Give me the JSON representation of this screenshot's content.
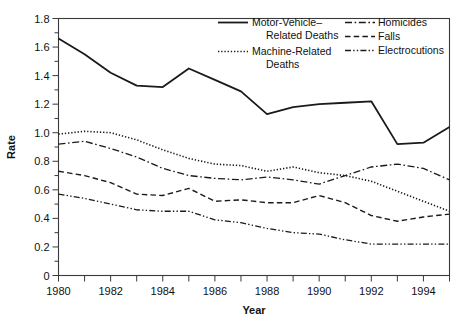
{
  "chart_data": {
    "type": "line",
    "title": "",
    "xlabel": "Year",
    "ylabel": "Rate",
    "xlim": [
      1980,
      1995
    ],
    "ylim": [
      0,
      1.8
    ],
    "ytick_step": 0.2,
    "yminor_step": 0.1,
    "xtick_step": 1,
    "xlabel_step": 2,
    "grid": false,
    "legend_position": "top-right-inside",
    "x": [
      1980,
      1981,
      1982,
      1983,
      1984,
      1985,
      1986,
      1987,
      1988,
      1989,
      1990,
      1991,
      1992,
      1993,
      1994,
      1995
    ],
    "xtick_labels": [
      "1980",
      "",
      "1982",
      "",
      "1984",
      "",
      "1986",
      "",
      "1988",
      "",
      "1990",
      "",
      "1992",
      "",
      "1994",
      ""
    ],
    "ytick_labels": [
      "0",
      "0.2",
      "0.4",
      "0.6",
      "0.8",
      "1.0",
      "1.2",
      "1.4",
      "1.6",
      "1.8"
    ],
    "ytick_values": [
      0,
      0.2,
      0.4,
      0.6,
      0.8,
      1.0,
      1.2,
      1.4,
      1.6,
      1.8
    ],
    "series": [
      {
        "name": "Motor-Vehicle–Related Deaths",
        "legend_line1": "Motor-Vehicle–",
        "legend_line2": "Related Deaths",
        "style": "solid",
        "dasharray": "",
        "width": 1.8,
        "values": [
          1.66,
          1.55,
          1.42,
          1.33,
          1.32,
          1.45,
          1.37,
          1.29,
          1.13,
          1.18,
          1.2,
          1.21,
          1.22,
          0.92,
          0.93,
          1.04
        ]
      },
      {
        "name": "Machine-Related Deaths",
        "legend_line1": "Machine-Related",
        "legend_line2": "Deaths",
        "style": "dotted",
        "dasharray": "1.3,1.9",
        "width": 1.6,
        "values": [
          0.99,
          1.01,
          1.0,
          0.95,
          0.88,
          0.82,
          0.78,
          0.77,
          0.73,
          0.76,
          0.72,
          0.7,
          0.66,
          0.59,
          0.52,
          0.45
        ]
      },
      {
        "name": "Homicides",
        "legend_line1": "Homicides",
        "legend_line2": "",
        "style": "dash-dot",
        "dasharray": "7,2.6,1.6,2.6",
        "width": 1.3,
        "values": [
          0.92,
          0.94,
          0.89,
          0.83,
          0.75,
          0.7,
          0.68,
          0.67,
          0.69,
          0.67,
          0.64,
          0.7,
          0.76,
          0.78,
          0.75,
          0.67
        ]
      },
      {
        "name": "Falls",
        "legend_line1": "Falls",
        "legend_line2": "",
        "style": "dashed",
        "dasharray": "5.5,3.2",
        "width": 1.4,
        "values": [
          0.73,
          0.7,
          0.65,
          0.57,
          0.56,
          0.61,
          0.52,
          0.53,
          0.51,
          0.51,
          0.56,
          0.51,
          0.42,
          0.38,
          0.41,
          0.43
        ]
      },
      {
        "name": "Electrocutions",
        "legend_line1": "Electrocutions",
        "legend_line2": "",
        "style": "dash-dot-dot",
        "dasharray": "6,2.2,1.4,2.2,1.4,2.2",
        "width": 1.3,
        "values": [
          0.57,
          0.54,
          0.5,
          0.46,
          0.45,
          0.45,
          0.39,
          0.37,
          0.33,
          0.3,
          0.29,
          0.25,
          0.22,
          0.22,
          0.22,
          0.22
        ]
      }
    ]
  },
  "legend": {
    "entries": [
      {
        "label_line1": "Motor-Vehicle–",
        "label_line2": "Related Deaths",
        "style": "solid"
      },
      {
        "label_line1": "Machine-Related",
        "label_line2": "Deaths",
        "style": "dotted"
      },
      {
        "label_line1": "Homicides",
        "label_line2": "",
        "style": "dash-dot"
      },
      {
        "label_line1": "Falls",
        "label_line2": "",
        "style": "dashed"
      },
      {
        "label_line1": "Electrocutions",
        "label_line2": "",
        "style": "dash-dot-dot"
      }
    ]
  },
  "colors": {
    "ink": "#1a1a1a",
    "frame": "#3a3a3a",
    "background": "#ffffff"
  }
}
